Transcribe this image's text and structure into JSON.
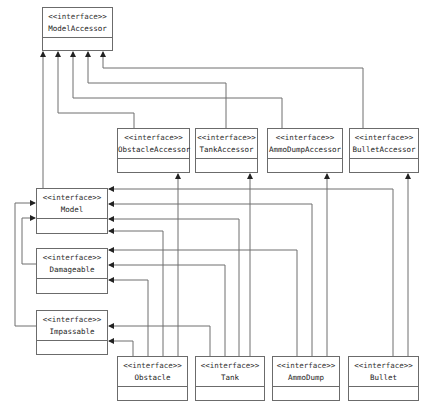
{
  "diagram": {
    "type": "UML interface hierarchy",
    "stereotype": "<<interface>>",
    "interfaces": [
      {
        "id": "model_accessor",
        "name": "ModelAccessor"
      },
      {
        "id": "obstacle_accessor",
        "name": "ObstacleAccessor"
      },
      {
        "id": "tank_accessor",
        "name": "TankAccessor"
      },
      {
        "id": "ammo_dump_accessor",
        "name": "AmmoDumpAccessor"
      },
      {
        "id": "bullet_accessor",
        "name": "BulletAccessor"
      },
      {
        "id": "model",
        "name": "Model"
      },
      {
        "id": "damageable",
        "name": "Damageable"
      },
      {
        "id": "impassable",
        "name": "Impassable"
      },
      {
        "id": "obstacle",
        "name": "Obstacle"
      },
      {
        "id": "tank",
        "name": "Tank"
      },
      {
        "id": "ammo_dump",
        "name": "AmmoDump"
      },
      {
        "id": "bullet",
        "name": "Bullet"
      }
    ],
    "generalizations": [
      {
        "from": "ObstacleAccessor",
        "to": "ModelAccessor"
      },
      {
        "from": "TankAccessor",
        "to": "ModelAccessor"
      },
      {
        "from": "AmmoDumpAccessor",
        "to": "ModelAccessor"
      },
      {
        "from": "BulletAccessor",
        "to": "ModelAccessor"
      },
      {
        "from": "Model",
        "to": "ModelAccessor"
      },
      {
        "from": "Damageable",
        "to": "Model"
      },
      {
        "from": "Impassable",
        "to": "Model"
      },
      {
        "from": "Obstacle",
        "to": "ObstacleAccessor"
      },
      {
        "from": "Tank",
        "to": "TankAccessor"
      },
      {
        "from": "AmmoDump",
        "to": "AmmoDumpAccessor"
      },
      {
        "from": "Bullet",
        "to": "BulletAccessor"
      },
      {
        "from": "Obstacle",
        "to": "Model"
      },
      {
        "from": "Tank",
        "to": "Model"
      },
      {
        "from": "AmmoDump",
        "to": "Model"
      },
      {
        "from": "Bullet",
        "to": "Model"
      },
      {
        "from": "Obstacle",
        "to": "Damageable"
      },
      {
        "from": "Tank",
        "to": "Damageable"
      },
      {
        "from": "AmmoDump",
        "to": "Damageable"
      },
      {
        "from": "Obstacle",
        "to": "Impassable"
      },
      {
        "from": "Tank",
        "to": "Impassable"
      }
    ]
  }
}
